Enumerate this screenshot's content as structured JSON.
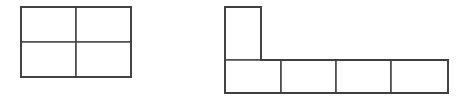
{
  "figure": {
    "background_color": "#ffffff",
    "stroke_color": "#4a4a4a",
    "outline_color": "#3f3f3f",
    "fill_color": "#ffffff",
    "stroke_width": 1.6,
    "canvas": {
      "width": 467,
      "height": 102
    }
  },
  "shapes": [
    {
      "name": "square-tetromino",
      "label": "2 by 2 block of four rectangles",
      "cell_count": 4,
      "rows": 2,
      "columns": 2,
      "origin": {
        "x": 21,
        "y": 7
      },
      "cell_size": {
        "width": 55,
        "height": 35
      },
      "bounds": {
        "x": 21,
        "y": 7,
        "width": 110,
        "height": 70
      },
      "cells": [
        {
          "name": "cell-r1c1",
          "x": 21,
          "y": 7,
          "width": 55,
          "height": 35
        },
        {
          "name": "cell-r1c2",
          "x": 76,
          "y": 7,
          "width": 55,
          "height": 35
        },
        {
          "name": "cell-r2c1",
          "x": 21,
          "y": 42,
          "width": 55,
          "height": 35
        },
        {
          "name": "cell-r2c2",
          "x": 76,
          "y": 42,
          "width": 55,
          "height": 35
        }
      ]
    },
    {
      "name": "l-pentomino",
      "label": "L shaped figure: one cell above the leftmost cell of a row of four cells",
      "cell_count": 5,
      "rows": 2,
      "columns": 4,
      "origin": {
        "x": 225,
        "y": 7
      },
      "cell_size": {
        "width": 56,
        "height": 33
      },
      "bounds": {
        "x": 225,
        "y": 7,
        "width": 223,
        "height": 86
      },
      "cells": [
        {
          "name": "cell-top-c1",
          "x": 225,
          "y": 7,
          "width": 36,
          "height": 53
        },
        {
          "name": "cell-bottom-c1",
          "x": 225,
          "y": 60,
          "width": 56,
          "height": 33
        },
        {
          "name": "cell-bottom-c2",
          "x": 281,
          "y": 60,
          "width": 55,
          "height": 33
        },
        {
          "name": "cell-bottom-c3",
          "x": 336,
          "y": 60,
          "width": 55,
          "height": 33
        },
        {
          "name": "cell-bottom-c4",
          "x": 391,
          "y": 60,
          "width": 57,
          "height": 33
        }
      ]
    }
  ]
}
